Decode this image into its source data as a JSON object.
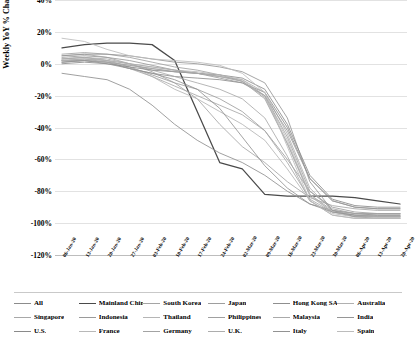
{
  "chart_data": {
    "type": "line",
    "title": "",
    "xlabel": "",
    "ylabel": "Weekly YoY % Change",
    "ylim": [
      -120,
      40
    ],
    "ytick_labels": [
      "40%",
      "20%",
      "0%",
      "-20%",
      "-40%",
      "-60%",
      "-80%",
      "-100%",
      "-120%"
    ],
    "ytick_values": [
      40,
      20,
      0,
      -20,
      -40,
      -60,
      -80,
      -100,
      -120
    ],
    "grid": true,
    "legend_position": "bottom",
    "x": [
      "06-Jan-20",
      "13-Jan-20",
      "20-Jan-20",
      "27-Jan-20",
      "03-Feb-20",
      "10-Feb-20",
      "17-Feb-20",
      "24-Feb-20",
      "02-Mar-20",
      "09-Mar-20",
      "16-Mar-20",
      "23-Mar-20",
      "30-Mar-20",
      "06-Apr-20",
      "13-Apr-20",
      "20-Apr-20"
    ],
    "series": [
      {
        "name": "All",
        "color": "#8c8c8c",
        "values": [
          2,
          2,
          1,
          -3,
          -6,
          -8,
          -9,
          -10,
          -12,
          -18,
          -40,
          -72,
          -86,
          -90,
          -91,
          -91
        ]
      },
      {
        "name": "Mainland China",
        "color": "#4a4a4a",
        "values": [
          10,
          12,
          13,
          13,
          12,
          2,
          -30,
          -62,
          -66,
          -82,
          -83,
          -83,
          -83,
          -84,
          -86,
          -88
        ]
      },
      {
        "name": "South Korea",
        "color": "#a5a5a5",
        "values": [
          5,
          6,
          4,
          0,
          -5,
          -12,
          -22,
          -38,
          -52,
          -62,
          -74,
          -84,
          -89,
          -91,
          -92,
          -92
        ]
      },
      {
        "name": "Japan",
        "color": "#9e9e9e",
        "values": [
          3,
          4,
          2,
          -2,
          -7,
          -12,
          -16,
          -22,
          -30,
          -42,
          -60,
          -80,
          -90,
          -93,
          -94,
          -94
        ]
      },
      {
        "name": "Hong Kong SAR",
        "color": "#8f8f8f",
        "values": [
          -6,
          -8,
          -10,
          -16,
          -26,
          -38,
          -48,
          -56,
          -62,
          -70,
          -80,
          -88,
          -92,
          -94,
          -95,
          -95
        ]
      },
      {
        "name": "Australia",
        "color": "#b0b0b0",
        "values": [
          1,
          2,
          1,
          -1,
          -3,
          -5,
          -6,
          -8,
          -10,
          -18,
          -44,
          -78,
          -92,
          -95,
          -96,
          -96
        ]
      },
      {
        "name": "Singapore",
        "color": "#a8a8a8",
        "values": [
          2,
          3,
          1,
          -3,
          -8,
          -14,
          -20,
          -26,
          -32,
          -42,
          -62,
          -85,
          -93,
          -96,
          -97,
          -97
        ]
      },
      {
        "name": "Indonesia",
        "color": "#9a9a9a",
        "values": [
          4,
          5,
          4,
          2,
          -1,
          -4,
          -6,
          -9,
          -12,
          -20,
          -42,
          -72,
          -86,
          -90,
          -91,
          -91
        ]
      },
      {
        "name": "Thailand",
        "color": "#b5b5b5",
        "values": [
          3,
          4,
          2,
          -2,
          -8,
          -16,
          -22,
          -30,
          -38,
          -48,
          -66,
          -86,
          -94,
          -96,
          -96,
          -96
        ]
      },
      {
        "name": "Philippines",
        "color": "#a0a0a0",
        "values": [
          6,
          7,
          6,
          4,
          1,
          -2,
          -4,
          -7,
          -11,
          -22,
          -50,
          -82,
          -92,
          -94,
          -94,
          -94
        ]
      },
      {
        "name": "Malaysia",
        "color": "#aaaaaa",
        "values": [
          3,
          4,
          3,
          0,
          -4,
          -8,
          -12,
          -16,
          -22,
          -34,
          -58,
          -86,
          -95,
          -97,
          -97,
          -97
        ]
      },
      {
        "name": "India",
        "color": "#969696",
        "values": [
          5,
          6,
          6,
          5,
          3,
          1,
          0,
          -2,
          -5,
          -12,
          -34,
          -74,
          -92,
          -96,
          -96,
          -96
        ]
      },
      {
        "name": "U.S.",
        "color": "#8a8a8a",
        "values": [
          0,
          1,
          0,
          -2,
          -4,
          -5,
          -6,
          -7,
          -9,
          -16,
          -38,
          -70,
          -85,
          -89,
          -90,
          -90
        ]
      },
      {
        "name": "France",
        "color": "#b8b8b8",
        "values": [
          2,
          3,
          2,
          0,
          -2,
          -4,
          -5,
          -7,
          -10,
          -20,
          -48,
          -82,
          -93,
          -95,
          -95,
          -95
        ]
      },
      {
        "name": "Germany",
        "color": "#a3a3a3",
        "values": [
          1,
          2,
          1,
          -1,
          -3,
          -5,
          -6,
          -8,
          -11,
          -20,
          -46,
          -80,
          -91,
          -94,
          -94,
          -94
        ]
      },
      {
        "name": "U.K.",
        "color": "#adadad",
        "values": [
          2,
          3,
          2,
          0,
          -2,
          -4,
          -6,
          -8,
          -11,
          -21,
          -50,
          -83,
          -93,
          -95,
          -96,
          -96
        ]
      },
      {
        "name": "Italy",
        "color": "#929292",
        "values": [
          1,
          2,
          0,
          -3,
          -6,
          -10,
          -16,
          -28,
          -46,
          -64,
          -78,
          -88,
          -93,
          -95,
          -95,
          -95
        ]
      },
      {
        "name": "Spain",
        "color": "#bcbcbc",
        "values": [
          16,
          14,
          9,
          5,
          3,
          2,
          1,
          -1,
          -6,
          -18,
          -52,
          -86,
          -95,
          -97,
          -97,
          -97
        ]
      }
    ]
  },
  "legend": {
    "rows": [
      [
        "All",
        "Mainland China",
        "South Korea",
        "Japan",
        "Hong Kong SAR",
        "Australia"
      ],
      [
        "Singapore",
        "Indonesia",
        "Thailand",
        "Philippines",
        "Malaysia",
        "India"
      ],
      [
        "U.S.",
        "France",
        "Germany",
        "U.K.",
        "Italy",
        "Spain"
      ]
    ]
  },
  "colors": {
    "gridline": "#e2e2e2",
    "axis": "#bdbdbd",
    "highlight": "#4a4a4a",
    "background": "#ffffff"
  }
}
